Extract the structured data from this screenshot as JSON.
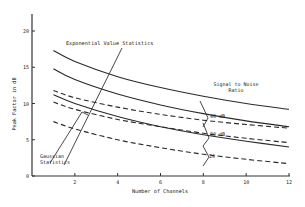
{
  "chart_data": {
    "type": "line",
    "title": "",
    "xlabel": "Number of Channels",
    "ylabel": "Peak Factor in dB",
    "xlim": [
      0,
      12
    ],
    "ylim": [
      0,
      20
    ],
    "x_ticks": [
      0,
      2,
      4,
      6,
      8,
      10,
      12
    ],
    "y_ticks": [
      0,
      5,
      10,
      15,
      20
    ],
    "grid": false,
    "x": [
      1,
      2,
      4,
      6,
      8,
      10,
      12
    ],
    "series": [
      {
        "name": "Exponential Value Statistics, 40 dB",
        "style": "solid",
        "values": [
          17.3,
          15.8,
          13.7,
          12.2,
          11.0,
          10.0,
          9.2
        ]
      },
      {
        "name": "Exponential Value Statistics, 30 dB",
        "style": "solid",
        "values": [
          14.8,
          13.3,
          11.3,
          9.8,
          8.6,
          7.6,
          6.8
        ]
      },
      {
        "name": "Gaussian Statistics, 40 dB",
        "style": "dashed",
        "values": [
          11.8,
          10.8,
          9.5,
          8.5,
          7.7,
          7.1,
          6.6
        ]
      },
      {
        "name": "Exponential Value Statistics, 20 dB",
        "style": "solid",
        "values": [
          11.2,
          10.0,
          8.2,
          6.8,
          5.7,
          4.8,
          4.0
        ]
      },
      {
        "name": "Gaussian Statistics, 30 dB",
        "style": "dashed",
        "values": [
          10.2,
          9.2,
          7.8,
          6.8,
          5.9,
          5.2,
          4.6
        ]
      },
      {
        "name": "Gaussian Statistics, 20 dB",
        "style": "dashed",
        "values": [
          7.5,
          6.5,
          5.0,
          3.9,
          3.0,
          2.3,
          1.7
        ]
      }
    ],
    "annotations": [
      {
        "text": "Exponential Value Statistics",
        "target": "solid curves"
      },
      {
        "text": "Gaussian Statistics",
        "target": "dashed curves"
      },
      {
        "text": "Signal to Noise Ratio",
        "position": "right"
      },
      {
        "text": "40 dB",
        "x": 8
      },
      {
        "text": "30 dB",
        "x": 8
      },
      {
        "text": "20",
        "x": 8
      }
    ]
  },
  "labels": {
    "exp": "Exponential Value Statistics",
    "gauss1": "Gaussian",
    "gauss2": "Statistics",
    "snr1": "Signal to Noise",
    "snr2": "Ratio",
    "snr40": "40 dB",
    "snr30": "30 dB",
    "snr20": "20",
    "xlabel": "Number of Channels",
    "ylabel": "Peak Factor in dB"
  }
}
